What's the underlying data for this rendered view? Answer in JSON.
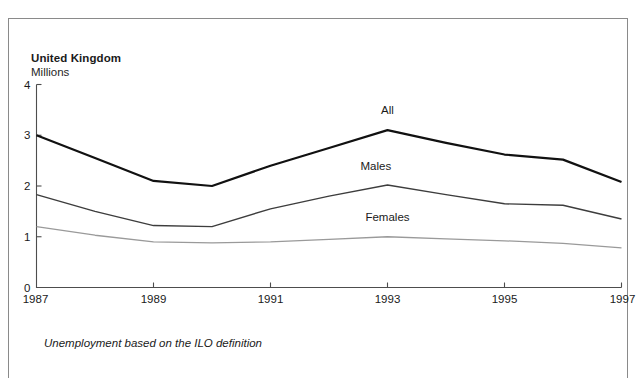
{
  "figure": {
    "title": "United Kingdom",
    "subtitle": "Millions",
    "footnote": "Unemployment based on the ILO definition"
  },
  "chart_data": {
    "type": "line",
    "title": "United Kingdom",
    "subtitle": "Millions",
    "xlabel": "",
    "ylabel": "Millions",
    "ylim": [
      0,
      4
    ],
    "xlim": [
      1987,
      1997
    ],
    "yticks": [
      "0",
      "1",
      "2",
      "3",
      "4"
    ],
    "ytick_values": [
      0,
      1,
      2,
      3,
      4
    ],
    "xticks": [
      "1987",
      "1989",
      "1991",
      "1993",
      "1995",
      "1997"
    ],
    "xtick_values": [
      1987,
      1989,
      1991,
      1993,
      1995,
      1997
    ],
    "x": [
      1987,
      1988,
      1989,
      1990,
      1991,
      1992,
      1993,
      1994,
      1995,
      1996,
      1997
    ],
    "grid": false,
    "legend_position": "inline-labels",
    "annotations": [
      "All",
      "Males",
      "Females"
    ],
    "note": "Unemployment based on the ILO definition",
    "series": [
      {
        "name": "All",
        "label": "All",
        "color": "#111111",
        "line_width": 2.2,
        "label_x": 1993.0,
        "label_y": 3.42,
        "values": [
          3.0,
          2.55,
          2.1,
          2.0,
          2.4,
          2.75,
          3.1,
          2.85,
          2.62,
          2.52,
          2.08
        ]
      },
      {
        "name": "Males",
        "label": "Males",
        "color": "#3d3d3d",
        "line_width": 1.45,
        "label_x": 1992.8,
        "label_y": 2.32,
        "values": [
          1.83,
          1.5,
          1.22,
          1.2,
          1.55,
          1.8,
          2.02,
          1.83,
          1.65,
          1.62,
          1.35
        ]
      },
      {
        "name": "Females",
        "label": "Females",
        "color": "#9a9a9a",
        "line_width": 1.3,
        "label_x": 1993.0,
        "label_y": 1.32,
        "values": [
          1.2,
          1.03,
          0.9,
          0.88,
          0.9,
          0.95,
          1.0,
          0.96,
          0.92,
          0.87,
          0.78
        ]
      }
    ]
  }
}
